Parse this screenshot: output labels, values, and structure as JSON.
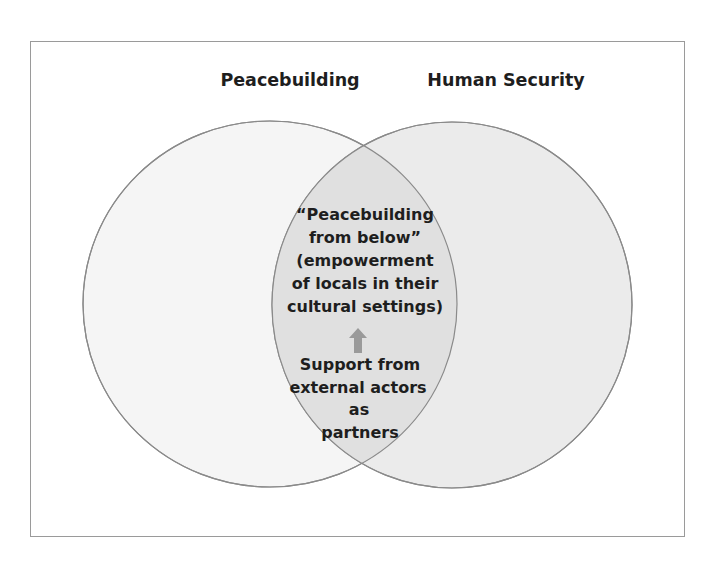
{
  "diagram": {
    "type": "venn",
    "sets": [
      {
        "id": "left",
        "label": "Peacebuilding"
      },
      {
        "id": "right",
        "label": "Human Security"
      }
    ],
    "intersection": {
      "upper_lines": [
        "“Peacebuilding",
        "from below”",
        "(empowerment",
        "of locals in their",
        "cultural settings)"
      ],
      "arrow": "up-arrow-icon",
      "lower_lines": [
        "Support from",
        "external actors",
        "as",
        "partners"
      ]
    },
    "colors": {
      "left_fill": "#f5f5f5",
      "right_fill": "#ebebeb",
      "overlap_fill": "#e0e0e0",
      "stroke": "#8a8a8a",
      "text": "#1e1e1e",
      "arrow": "#9a9a9a"
    }
  }
}
